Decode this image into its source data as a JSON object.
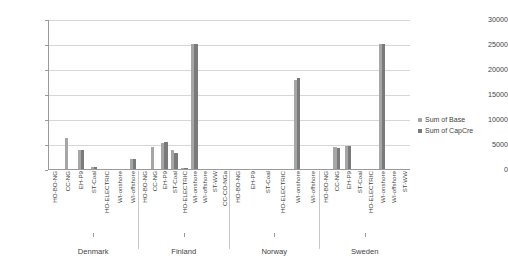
{
  "chart_data": {
    "type": "bar",
    "title": "",
    "xlabel": "",
    "ylabel": "",
    "ylim": [
      0,
      30000
    ],
    "grid": true,
    "legend_position": "right",
    "yticks": [
      30000,
      25000,
      20000,
      15000,
      10000,
      5000,
      0
    ],
    "groups": [
      "Denmark",
      "Finland",
      "Norway",
      "Sweden"
    ],
    "categories": [
      "HO-BO-NG",
      "CC-NG",
      "EH-P9",
      "ST-Coal",
      "HO-ELECTRIC",
      "WI-onshore",
      "WI-offshore",
      "ST-WW",
      "CC-CO-NGa"
    ],
    "series": [
      {
        "name": "Sum of Base",
        "color": "#a6a6a6"
      },
      {
        "name": "Sum of CapCre",
        "color": "#7a7a7a"
      }
    ],
    "grouped_values": [
      {
        "group": "Denmark",
        "categories": [
          "HO-BO-NG",
          "CC-NG",
          "EH-P9",
          "ST-Coal",
          "HO-ELECTRIC",
          "WI-onshore",
          "WI-offshore"
        ],
        "Sum of Base": [
          0,
          6150,
          3750,
          400,
          0,
          0,
          2100
        ],
        "Sum of CapCre": [
          0,
          0,
          3800,
          500,
          0,
          0,
          2050
        ]
      },
      {
        "group": "Finland",
        "categories": [
          "HO-BO-NG",
          "CC-NG",
          "EH-P9",
          "ST-Coal",
          "HO-ELECTRIC",
          "WI-onshore",
          "WI-offshore",
          "ST-WW",
          "CC-CO-NGa"
        ],
        "Sum of Base": [
          0,
          4400,
          5300,
          3900,
          250,
          25000,
          0,
          0,
          0
        ],
        "Sum of CapCre": [
          0,
          0,
          5400,
          3250,
          200,
          25000,
          0,
          0,
          0
        ]
      },
      {
        "group": "Norway",
        "categories": [
          "HO-BO-NG",
          "EH-P9",
          "ST-Coal",
          "HO-ELECTRIC",
          "WI-onshore",
          "WI-offshore"
        ],
        "Sum of Base": [
          0,
          100,
          0,
          0,
          17800,
          0
        ],
        "Sum of CapCre": [
          0,
          0,
          0,
          0,
          18200,
          0
        ]
      },
      {
        "group": "Sweden",
        "categories": [
          "HO-BO-NG",
          "CC-NG",
          "EH-P9",
          "ST-Coal",
          "HO-ELECTRIC",
          "WI-onshore",
          "WI-offshore",
          "ST-WW"
        ],
        "Sum of Base": [
          0,
          4400,
          4600,
          0,
          0,
          25000,
          0,
          0
        ],
        "Sum of CapCre": [
          0,
          4300,
          4700,
          0,
          0,
          25000,
          0,
          0
        ]
      }
    ]
  },
  "axis": {
    "ytick_labels": [
      "30000",
      "25000",
      "20000",
      "15000",
      "10000",
      "5000",
      "0"
    ]
  },
  "legend": {
    "items": [
      {
        "label": "Sum of Base",
        "swatch": "base"
      },
      {
        "label": "Sum of CapCre",
        "swatch": "capcre"
      }
    ]
  },
  "group_labels": [
    "Denmark",
    "Finland",
    "Norway",
    "Sweden"
  ],
  "xaxis_labels": {
    "Denmark": [
      "HO-BO-NG",
      "CC-NG",
      "EH-P9",
      "ST-Coal",
      "HO-ELECTRIC",
      "WI-onshore",
      "WI-offshore"
    ],
    "Finland": [
      "HO-BO-NG",
      "CC-NG",
      "EH-P9",
      "ST-Coal",
      "HO-ELECTRIC",
      "WI-onshore",
      "WI-offshore",
      "ST-WW",
      "CC-CO-NGa"
    ],
    "Norway": [
      "HO-BO-NG",
      "EH-P9",
      "ST-Coal",
      "HO-ELECTRIC",
      "WI-onshore",
      "WI-offshore"
    ],
    "Sweden": [
      "HO-BO-NG",
      "CC-NG",
      "EH-P9",
      "ST-Coal",
      "HO-ELECTRIC",
      "WI-onshore",
      "WI-offshore",
      "ST-WW"
    ]
  }
}
